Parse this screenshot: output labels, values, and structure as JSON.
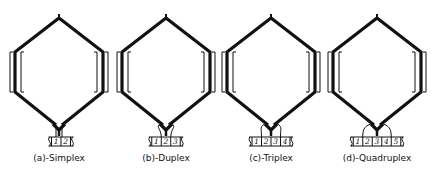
{
  "figure": {
    "panels": [
      {
        "id": "a",
        "label": "(a)-Simplex",
        "cx": 59,
        "segments": [
          "1",
          "2"
        ]
      },
      {
        "id": "b",
        "label": "(b)-Duplex",
        "cx": 166,
        "segments": [
          "1",
          "2",
          "3"
        ]
      },
      {
        "id": "c",
        "label": "(c)-Triplex",
        "cx": 271,
        "segments": [
          "1",
          "2",
          "3",
          "4"
        ]
      },
      {
        "id": "d",
        "label": "(d)-Quadruplex",
        "cx": 377,
        "segments": [
          "1",
          "2",
          "3",
          "4",
          "5"
        ]
      }
    ],
    "colors": {
      "stroke": "#111111",
      "background": "#ffffff"
    }
  }
}
